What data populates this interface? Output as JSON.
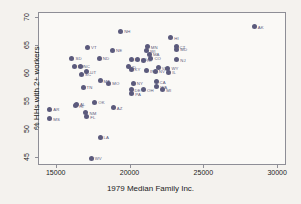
{
  "chart_data": {
    "type": "scatter",
    "title": "",
    "xlabel": "1979 Median Family Inc.",
    "ylabel": "% HHs with 2+ workers",
    "xlim": [
      13800,
      30600
    ],
    "ylim": [
      43.6,
      70.8
    ],
    "xticks": [
      15000,
      20000,
      25000,
      30000
    ],
    "yticks": [
      45,
      50,
      55,
      60,
      65,
      70
    ],
    "grid": false,
    "legend": "none",
    "marker_color": "#5b5a7c",
    "plot_background": "#faf9f6",
    "figure_background": "#f4f2ee",
    "axis_color": "#8e8e96",
    "points": [
      {
        "label": "AK",
        "x": 28450,
        "y": 68.2
      },
      {
        "label": "NH",
        "x": 19400,
        "y": 67.4
      },
      {
        "label": "HI",
        "x": 22800,
        "y": 66.2
      },
      {
        "label": "VT",
        "x": 17150,
        "y": 64.5
      },
      {
        "label": "MN",
        "x": 21200,
        "y": 64.6
      },
      {
        "label": "CT",
        "x": 23150,
        "y": 64.6
      },
      {
        "label": "MD",
        "x": 23200,
        "y": 64.2
      },
      {
        "label": "WI",
        "x": 21150,
        "y": 63.9
      },
      {
        "label": "NE",
        "x": 18850,
        "y": 64.0
      },
      {
        "label": "MA",
        "x": 21350,
        "y": 63.3
      },
      {
        "label": "SD",
        "x": 16100,
        "y": 62.6
      },
      {
        "label": "ND",
        "x": 17950,
        "y": 62.6
      },
      {
        "label": "CO",
        "x": 21450,
        "y": 62.6
      },
      {
        "label": "NJ",
        "x": 23200,
        "y": 62.3
      },
      {
        "label": "IA",
        "x": 20100,
        "y": 62.4
      },
      {
        "label": "KS",
        "x": 20550,
        "y": 62.4
      },
      {
        "label": "RI",
        "x": 20950,
        "y": 62.2
      },
      {
        "label": "ME",
        "x": 16250,
        "y": 61.2
      },
      {
        "label": "NC",
        "x": 16650,
        "y": 61.2
      },
      {
        "label": "ID",
        "x": 19900,
        "y": 61.1
      },
      {
        "label": "KY",
        "x": 20100,
        "y": 60.6
      },
      {
        "label": "WY",
        "x": 22600,
        "y": 60.8
      },
      {
        "label": "UT",
        "x": 17100,
        "y": 60.2
      },
      {
        "label": "SC",
        "x": 16750,
        "y": 59.7
      },
      {
        "label": "IN",
        "x": 21150,
        "y": 60.4
      },
      {
        "label": "NV",
        "x": 21750,
        "y": 60.3
      },
      {
        "label": "IL",
        "x": 22650,
        "y": 60.1
      },
      {
        "label": "VA",
        "x": 21950,
        "y": 60.9
      },
      {
        "label": "MT",
        "x": 18000,
        "y": 58.6
      },
      {
        "label": "MO",
        "x": 18600,
        "y": 58.1
      },
      {
        "label": "TN",
        "x": 16850,
        "y": 57.4
      },
      {
        "label": "NY",
        "x": 20250,
        "y": 58.1
      },
      {
        "label": "CA",
        "x": 21800,
        "y": 58.4
      },
      {
        "label": "WA",
        "x": 21850,
        "y": 57.5
      },
      {
        "label": "DE",
        "x": 20100,
        "y": 57.0
      },
      {
        "label": "PA",
        "x": 20150,
        "y": 56.3
      },
      {
        "label": "OH",
        "x": 20950,
        "y": 57.0
      },
      {
        "label": "MI",
        "x": 22250,
        "y": 57.0
      },
      {
        "label": "OK",
        "x": 17650,
        "y": 54.8
      },
      {
        "label": "AL",
        "x": 16400,
        "y": 54.4
      },
      {
        "label": "HI2",
        "x": 16350,
        "y": 54.1
      },
      {
        "label": "AR",
        "x": 14600,
        "y": 53.5
      },
      {
        "label": "AZ",
        "x": 18900,
        "y": 53.8
      },
      {
        "label": "NM",
        "x": 17050,
        "y": 52.9
      },
      {
        "label": "FL",
        "x": 17100,
        "y": 52.2
      },
      {
        "label": "MS",
        "x": 14600,
        "y": 51.8
      },
      {
        "label": "LA",
        "x": 18000,
        "y": 48.5
      },
      {
        "label": "WV",
        "x": 17400,
        "y": 44.8
      }
    ]
  }
}
